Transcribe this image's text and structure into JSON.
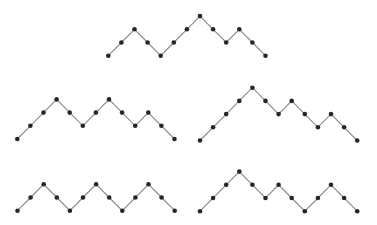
{
  "diagram": {
    "colors": {
      "background": "#ffffff",
      "edge": "#8a8a8a",
      "vertex": "#262626"
    },
    "step_x": 13.1,
    "step_y": 13.2,
    "vertex_radius": 2.3,
    "paths": [
      {
        "id": "top",
        "origin": [
          108.3,
          55.7
        ],
        "heights": [
          0,
          1,
          2,
          1,
          0,
          1,
          2,
          3,
          2,
          1,
          2,
          1,
          0
        ]
      },
      {
        "id": "middle-left",
        "origin": [
          17.3,
          139.0
        ],
        "heights": [
          0,
          1,
          2,
          3,
          2,
          1,
          2,
          3,
          2,
          1,
          2,
          1,
          0
        ]
      },
      {
        "id": "middle-right",
        "origin": [
          200.0,
          140.5
        ],
        "heights": [
          0,
          1,
          2,
          3,
          4,
          3,
          2,
          3,
          2,
          1,
          2,
          1,
          0
        ]
      },
      {
        "id": "bottom-left",
        "origin": [
          17.5,
          210.7
        ],
        "heights": [
          0,
          1,
          2,
          1,
          0,
          1,
          2,
          1,
          0,
          1,
          2,
          1,
          0
        ]
      },
      {
        "id": "bottom-right",
        "origin": [
          200.0,
          211.2
        ],
        "heights": [
          0,
          1,
          2,
          3,
          2,
          1,
          2,
          1,
          0,
          1,
          2,
          1,
          0
        ]
      }
    ]
  }
}
